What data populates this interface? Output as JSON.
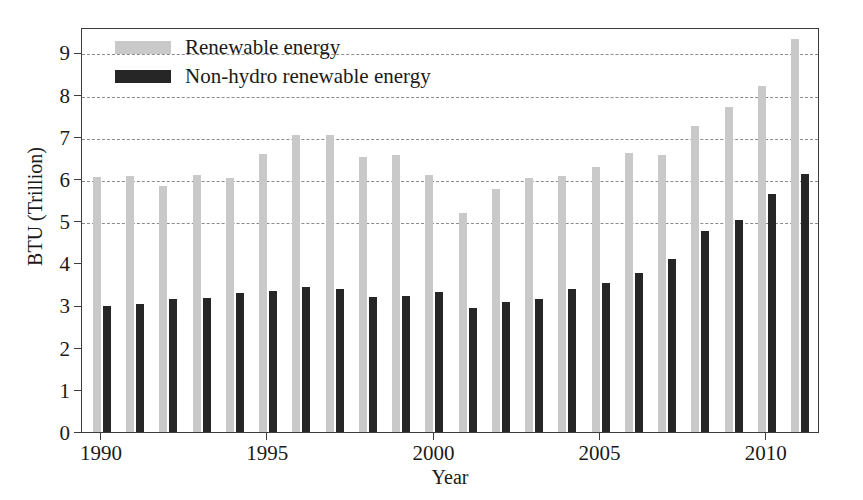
{
  "chart_data": {
    "type": "bar",
    "title": "",
    "xlabel": "Year",
    "ylabel": "BTU (Trillion)",
    "xlim": [
      1989.4,
      2011.6
    ],
    "ylim": [
      0,
      9.6
    ],
    "yticks": [
      0,
      1,
      2,
      3,
      4,
      5,
      6,
      7,
      8,
      9
    ],
    "ytick_labels": [
      "0",
      "1",
      "2",
      "3",
      "4",
      "5",
      "6",
      "7",
      "8",
      "9"
    ],
    "xticks": [
      1990,
      1995,
      2000,
      2005,
      2010
    ],
    "xtick_labels": [
      "1990",
      "1995",
      "2000",
      "2005",
      "2010"
    ],
    "grid": "horizontal-dashed",
    "gridline_values": [
      5,
      6,
      7,
      8,
      9
    ],
    "legend_position": "upper-left-inside",
    "categories": [
      1990,
      1991,
      1992,
      1993,
      1994,
      1995,
      1996,
      1997,
      1998,
      1999,
      2000,
      2001,
      2002,
      2003,
      2004,
      2005,
      2006,
      2007,
      2008,
      2009,
      2010,
      2011
    ],
    "series": [
      {
        "name": "Renewable energy",
        "color": "#c9c9c9",
        "values": [
          6.04,
          6.07,
          5.84,
          6.1,
          6.02,
          6.58,
          7.04,
          7.03,
          6.52,
          6.56,
          6.1,
          5.2,
          5.77,
          6.03,
          6.08,
          6.28,
          6.62,
          6.56,
          7.25,
          7.7,
          8.2,
          9.32
        ]
      },
      {
        "name": "Non-hydro renewable energy",
        "color": "#262626",
        "values": [
          2.99,
          3.03,
          3.16,
          3.18,
          3.29,
          3.35,
          3.43,
          3.4,
          3.19,
          3.23,
          3.31,
          2.94,
          3.08,
          3.15,
          3.4,
          3.54,
          3.78,
          4.11,
          4.77,
          5.03,
          5.63,
          6.12
        ]
      }
    ]
  },
  "legend": {
    "items": [
      {
        "label": "Renewable energy",
        "swatch_class": "renewable"
      },
      {
        "label": "Non-hydro renewable energy",
        "swatch_class": "nonhydro"
      }
    ]
  }
}
